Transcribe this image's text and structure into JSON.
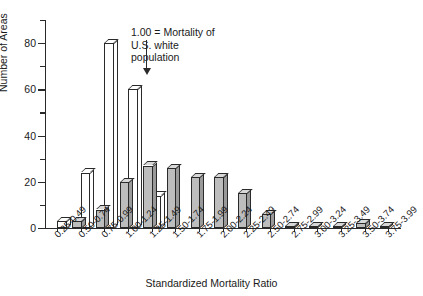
{
  "chart_data": {
    "type": "bar",
    "title": "",
    "xlabel": "Standardized Mortality Ratio",
    "ylabel": "Number of Areas",
    "ylim": [
      0,
      90
    ],
    "yticks": [
      0,
      20,
      40,
      60,
      80
    ],
    "yticks_minor": [
      10,
      30,
      50,
      70,
      90
    ],
    "grid": false,
    "legend": "none",
    "categories": [
      "0.25-0.49",
      "0.50-0.74",
      "0.75-0.99",
      "1.00-1.24",
      "1.25-1.49",
      "1.50-1.74",
      "1.75-1.99",
      "2.00-2.24",
      "2.25-2.49",
      "2.50-2.74",
      "2.75-2.99",
      "3.00-3.24",
      "3.25-3.49",
      "3.50-3.74",
      "3.75-3.99"
    ],
    "series": [
      {
        "name": "white",
        "style": "white-3d",
        "values": [
          3,
          24,
          80,
          60,
          14,
          null,
          null,
          null,
          null,
          null,
          null,
          null,
          null,
          null,
          null
        ]
      },
      {
        "name": "gray",
        "style": "gray-3d",
        "values": [
          0,
          3,
          8,
          20,
          27,
          26,
          22,
          22,
          15,
          6,
          1,
          1,
          1,
          2,
          1
        ]
      }
    ],
    "annotations": [
      {
        "text": "1.00 = Mortality of\nU.S. white\npopulation",
        "marker": "down-arrow",
        "points_to": "1.00-1.24"
      }
    ]
  },
  "axes": {
    "y_tick_labels": [
      "0",
      "20",
      "40",
      "60",
      "80"
    ],
    "y_axis_title": "Number of Areas",
    "x_axis_title": "Standardized Mortality Ratio"
  }
}
